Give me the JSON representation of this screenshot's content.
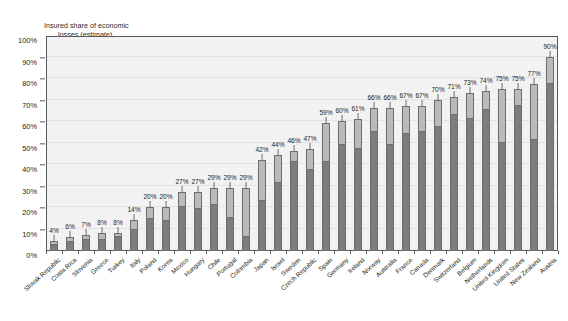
{
  "chart_data": {
    "type": "bar",
    "title": "Insured share of economic losses (estimate)",
    "title_line1": "Insured share of economic",
    "title_line2": "losses (estimate)",
    "xlabel": "",
    "ylabel": "",
    "ylim": [
      0,
      100
    ],
    "grid": true,
    "legend": "none",
    "y_ticks": [
      "0%",
      "10%",
      "20%",
      "30%",
      "40%",
      "50%",
      "60%",
      "70%",
      "80%",
      "90%",
      "100%"
    ],
    "y_tick_values": [
      0,
      10,
      20,
      30,
      40,
      50,
      60,
      70,
      80,
      90,
      100
    ],
    "categories": [
      "Slovak Republic",
      "Costa Rica",
      "Slovenia",
      "Greece",
      "Turkey",
      "Italy",
      "Poland",
      "Korea",
      "Mexico",
      "Hungary",
      "Chile",
      "Portugal",
      "Colombia",
      "Japan",
      "Israel",
      "Sweden",
      "Czech Republic",
      "Spain",
      "Germany",
      "Ireland",
      "Norway",
      "Australia",
      "France",
      "Canada",
      "Denmark",
      "Switzerland",
      "Belgium",
      "Netherlands",
      "United Kingdom",
      "United States",
      "New Zealand",
      "Austria"
    ],
    "values": [
      4,
      6,
      7,
      8,
      8,
      14,
      20,
      20,
      27,
      27,
      29,
      29,
      29,
      42,
      44,
      46,
      47,
      59,
      60,
      61,
      66,
      66,
      67,
      67,
      70,
      71,
      73,
      74,
      75,
      75,
      77,
      90
    ],
    "labels": [
      "4%",
      "6%",
      "7%",
      "8%",
      "8%",
      "14%",
      "20%",
      "20%",
      "27%",
      "27%",
      "29%",
      "29%",
      "29%",
      "42%",
      "44%",
      "46%",
      "47%",
      "59%",
      "60%",
      "61%",
      "66%",
      "66%",
      "67%",
      "67%",
      "70%",
      "71%",
      "73%",
      "74%",
      "75%",
      "75%",
      "77%",
      "90%"
    ],
    "series": [
      {
        "name": "lower estimate",
        "values": [
          2.5,
          3.5,
          4.5,
          4.5,
          6,
          9.5,
          14.5,
          13.5,
          20,
          19,
          21,
          15,
          6,
          23,
          31,
          41,
          37,
          41,
          49,
          47,
          55,
          49,
          54,
          55,
          57,
          63,
          61,
          65,
          50,
          67,
          51,
          77
        ]
      },
      {
        "name": "upper estimate",
        "values": [
          4,
          6,
          7,
          8,
          8,
          14,
          20,
          20,
          27,
          27,
          29,
          29,
          29,
          42,
          44,
          46,
          47,
          59,
          60,
          61,
          66,
          66,
          67,
          67,
          70,
          71,
          73,
          74,
          75,
          75,
          77,
          90
        ]
      }
    ],
    "colors": {
      "bar_lower": "#7b7c7e",
      "bar_upper": "#b9babc",
      "bar_border": "#6d6e71",
      "plot_background": "#f2f2f2",
      "gridline": "#e2e2e2",
      "axis": "#58595b",
      "text": "#231f20"
    }
  }
}
